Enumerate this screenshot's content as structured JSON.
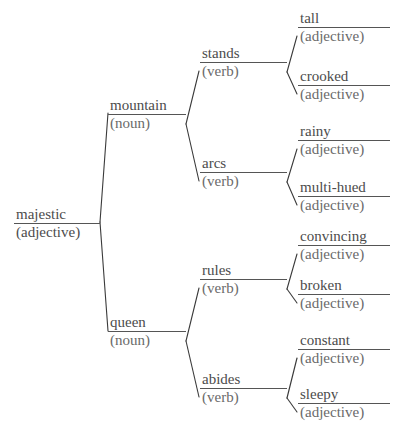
{
  "diagram": {
    "type": "word-association-tree",
    "background_color": "#ffffff",
    "line_color": "#3a3a3a",
    "text_color": "#4c4c4c",
    "root": {
      "id": "root",
      "word": "majestic",
      "pos": "(adjective)"
    },
    "level1": [
      {
        "id": "mountain",
        "word": "mountain",
        "pos": "(noun)"
      },
      {
        "id": "queen",
        "word": "queen",
        "pos": "(noun)"
      }
    ],
    "level2": [
      {
        "id": "stands",
        "word": "stands",
        "pos": "(verb)",
        "parent": "mountain"
      },
      {
        "id": "arcs",
        "word": "arcs",
        "pos": "(verb)",
        "parent": "mountain"
      },
      {
        "id": "rules",
        "word": "rules",
        "pos": "(verb)",
        "parent": "queen"
      },
      {
        "id": "abides",
        "word": "abides",
        "pos": "(verb)",
        "parent": "queen"
      }
    ],
    "level3": [
      {
        "id": "tall",
        "word": "tall",
        "pos": "(adjective)",
        "parent": "stands"
      },
      {
        "id": "crooked",
        "word": "crooked",
        "pos": "(adjective)",
        "parent": "stands"
      },
      {
        "id": "rainy",
        "word": "rainy",
        "pos": "(adjective)",
        "parent": "arcs"
      },
      {
        "id": "multi-hued",
        "word": "multi-hued",
        "pos": "(adjective)",
        "parent": "arcs"
      },
      {
        "id": "convincing",
        "word": "convincing",
        "pos": "(adjective)",
        "parent": "rules"
      },
      {
        "id": "broken",
        "word": "broken",
        "pos": "(adjective)",
        "parent": "rules"
      },
      {
        "id": "constant",
        "word": "constant",
        "pos": "(adjective)",
        "parent": "abides"
      },
      {
        "id": "sleepy",
        "word": "sleepy",
        "pos": "(adjective)",
        "parent": "abides"
      }
    ]
  }
}
